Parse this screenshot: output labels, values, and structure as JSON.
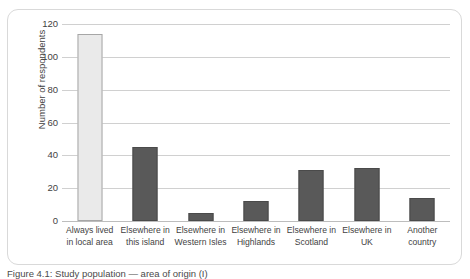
{
  "figure": {
    "caption": "Figure 4.1: Study population — area of origin (I)"
  },
  "chart_data": {
    "type": "bar",
    "title": "",
    "xlabel": "",
    "ylabel": "Number of respondents",
    "ylim": [
      0,
      120
    ],
    "yticks": [
      0,
      20,
      40,
      60,
      80,
      100,
      120
    ],
    "ytick_labels": [
      "0",
      "20",
      "40",
      "60",
      "80",
      "100",
      "120"
    ],
    "grid": "horizontal",
    "legend": "none",
    "categories": [
      "Always lived in local area",
      "Elsewhere in this island",
      "Elsewhere in Western Isles",
      "Elsewhere in Highlands",
      "Elsewhere in Scotland",
      "Elsewhere in UK",
      "Another country"
    ],
    "category_lines": [
      [
        "Always lived",
        "in local area"
      ],
      [
        "Elsewhere in",
        "this island"
      ],
      [
        "Elsewhere in",
        "Western Isles"
      ],
      [
        "Elsewhere in",
        "Highlands"
      ],
      [
        "Elsewhere in",
        "Scotland"
      ],
      [
        "Elsewhere in",
        "UK"
      ],
      [
        "Another",
        "country"
      ]
    ],
    "values": [
      114,
      45,
      5,
      12,
      31,
      32,
      14
    ],
    "bar_styles": [
      "light",
      "dark",
      "dark",
      "dark",
      "dark",
      "dark",
      "dark"
    ],
    "colors": {
      "bar_dark": "#595959",
      "bar_dark_edge": "#4a4a4a",
      "bar_light": "#eaeaea",
      "bar_light_edge": "#a6a6a6",
      "gridline": "#d0d0d0",
      "axis_text": "#3f3f3f",
      "frame": "#d9d9d9"
    }
  }
}
